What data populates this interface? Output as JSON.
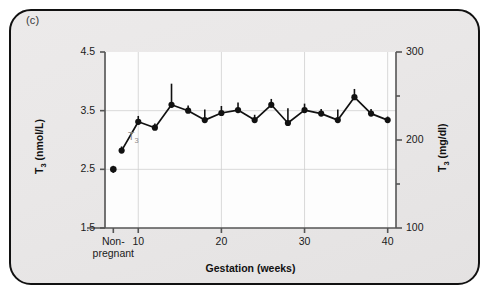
{
  "figure": {
    "panel_label": "(c)",
    "background_color": "#e9e7e7",
    "border_color": "#111111",
    "plot_background": "#fdfdfd",
    "marker_color": "#111111",
    "series_tag_color": "#8a8a8a"
  },
  "chart_data": {
    "type": "line",
    "title": "",
    "subtitle": "",
    "xlabel": "Gestation (weeks)",
    "ylabel": "T3 (nmol/L)",
    "ylabel_text": "T",
    "ylabel_sub": "3",
    "ylabel_unit": " (nmol/L)",
    "y2label": "T3 (mg/dl)",
    "y2label_text": "T",
    "y2label_sub": "3",
    "y2label_unit": " (mg/dl)",
    "grid": true,
    "legend_position": "inline-annotation",
    "annotations": [
      {
        "text": "T",
        "sub": "3",
        "x": 9.5,
        "y": 3.05,
        "color": "#8a8a8a"
      }
    ],
    "xlim": [
      6,
      41
    ],
    "ylim": [
      1.5,
      4.5
    ],
    "y2lim": [
      100,
      300
    ],
    "yticks": [
      1.5,
      2.5,
      3.5,
      4.5
    ],
    "ytick_labels": [
      "1.5",
      "2.5",
      "3.5",
      "4.5"
    ],
    "y2ticks": [
      100,
      150,
      200,
      250,
      300
    ],
    "y2tick_labels": [
      "100",
      "",
      "200",
      "",
      "300"
    ],
    "y2major": [
      100,
      200,
      300
    ],
    "xticks": [
      10,
      20,
      30,
      40
    ],
    "xtick_labels": [
      "10",
      "20",
      "30",
      "40"
    ],
    "x_special_tick": {
      "label_line1": "Non-",
      "label_line2": "pregnant",
      "value": 7.0
    },
    "series": [
      {
        "name": "T3",
        "detached_point": {
          "category": "Non-pregnant",
          "x": 7.0,
          "y": 2.5,
          "err_up": 0.06,
          "err_down": 0.06
        },
        "x": [
          8,
          10,
          12,
          14,
          16,
          18,
          20,
          22,
          24,
          26,
          28,
          30,
          32,
          34,
          36,
          38,
          40
        ],
        "values": [
          2.82,
          3.31,
          3.21,
          3.6,
          3.5,
          3.34,
          3.46,
          3.51,
          3.34,
          3.6,
          3.29,
          3.51,
          3.45,
          3.34,
          3.73,
          3.45,
          3.34
        ],
        "err_up": [
          0.07,
          0.1,
          0.07,
          0.36,
          0.09,
          0.18,
          0.12,
          0.13,
          0.09,
          0.1,
          0.25,
          0.11,
          0.08,
          0.18,
          0.14,
          0.08,
          0.06
        ]
      }
    ]
  }
}
